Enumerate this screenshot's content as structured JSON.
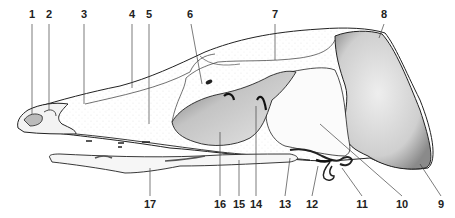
{
  "figure": {
    "style": "stippled line drawing",
    "colors": {
      "ink": "#222222",
      "background": "#ffffff",
      "shade_dark": "#555555",
      "shade_light": "#d8d8d8"
    }
  },
  "labels": {
    "top": [
      {
        "n": "1",
        "x": 32,
        "y": 9
      },
      {
        "n": "2",
        "x": 49,
        "y": 9
      },
      {
        "n": "3",
        "x": 84,
        "y": 9
      },
      {
        "n": "4",
        "x": 132,
        "y": 9
      },
      {
        "n": "5",
        "x": 149,
        "y": 9
      },
      {
        "n": "6",
        "x": 190,
        "y": 9
      },
      {
        "n": "7",
        "x": 275,
        "y": 9
      },
      {
        "n": "8",
        "x": 384,
        "y": 9
      }
    ],
    "bottom": [
      {
        "n": "9",
        "x": 441,
        "y": 199
      },
      {
        "n": "10",
        "x": 402,
        "y": 199
      },
      {
        "n": "11",
        "x": 362,
        "y": 199
      },
      {
        "n": "12",
        "x": 312,
        "y": 199
      },
      {
        "n": "13",
        "x": 285,
        "y": 199
      },
      {
        "n": "14",
        "x": 256,
        "y": 199
      },
      {
        "n": "15",
        "x": 239,
        "y": 199
      },
      {
        "n": "16",
        "x": 220,
        "y": 199
      },
      {
        "n": "17",
        "x": 150,
        "y": 199
      }
    ]
  }
}
